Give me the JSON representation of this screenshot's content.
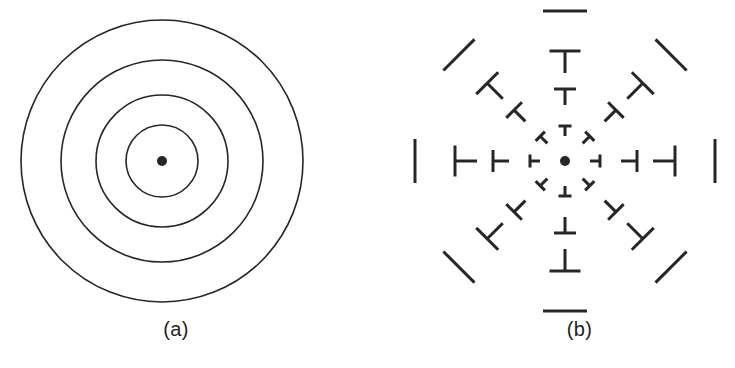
{
  "figure": {
    "background_color": "#ffffff",
    "stroke_color": "#262626",
    "width": 735,
    "height": 368
  },
  "panels": [
    {
      "id": "a",
      "caption": "(a)",
      "type": "concentric-circles",
      "center": {
        "x": 162,
        "y": 161
      },
      "dot_radius": 5,
      "circle_radii": [
        36,
        66,
        101,
        141
      ],
      "circle_count": 4,
      "stroke_width": 1.6
    },
    {
      "id": "b",
      "caption": "(b)",
      "type": "radial-tick-pattern",
      "center": {
        "x": 197,
        "y": 161
      },
      "dot_radius": 5,
      "spoke_count": 8,
      "spoke_angles_deg": [
        0,
        45,
        90,
        135,
        180,
        225,
        270,
        315
      ],
      "ring_count": 4,
      "ring_radii": [
        35,
        72,
        110,
        150
      ],
      "cap_lengths": [
        13,
        22,
        31,
        44
      ],
      "stem_lengths": [
        10,
        16,
        22,
        0
      ],
      "stroke_width": 3.0
    }
  ],
  "chart_data": {
    "type": "scatter",
    "title": "",
    "xlabel": "",
    "ylabel": "",
    "annotations": [
      "(a)",
      "(b)"
    ],
    "series": [
      {
        "name": "panel-a-concentric-circles",
        "radii": [
          36,
          66,
          101,
          141
        ],
        "center": [
          162,
          161
        ]
      },
      {
        "name": "panel-b-radial-ticks",
        "ring_radii": [
          35,
          72,
          110,
          150
        ],
        "angles_deg": [
          0,
          45,
          90,
          135,
          180,
          225,
          270,
          315
        ],
        "center": [
          197,
          161
        ]
      }
    ]
  }
}
